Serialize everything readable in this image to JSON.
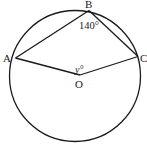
{
  "diagram": {
    "type": "circle-geometry",
    "stroke_color": "#1a1a1a",
    "circle": {
      "center_label": "O"
    },
    "points": {
      "A": {
        "label": "A"
      },
      "B": {
        "label": "B"
      },
      "C": {
        "label": "C"
      },
      "O": {
        "label": "O"
      }
    },
    "angles": {
      "ABC": {
        "label": "140°"
      },
      "AOC": {
        "label": "y°"
      }
    },
    "segments": [
      "AB",
      "BC",
      "AO",
      "OC"
    ]
  }
}
